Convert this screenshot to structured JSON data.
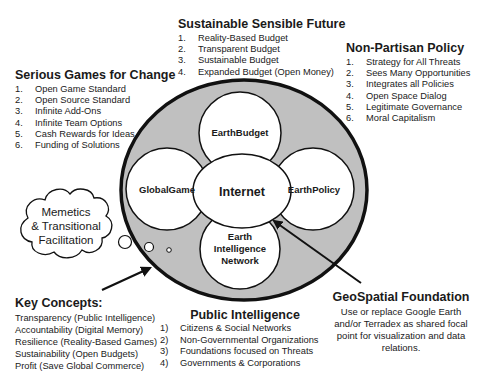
{
  "diagram": {
    "center": {
      "label": "Internet"
    },
    "nodes": [
      {
        "id": "earthbudget",
        "label": "EarthBudget"
      },
      {
        "id": "globalgame",
        "label": "GlobalGame"
      },
      {
        "id": "earthpolicy",
        "label": "EarthPolicy"
      },
      {
        "id": "ein",
        "label_lines": [
          "Earth",
          "Intelligence",
          "Network"
        ]
      }
    ],
    "cloud": {
      "lines": [
        "Memetics",
        "& Transitional",
        "Facilitation"
      ]
    },
    "colors": {
      "ring_fill": "#c0c0c0",
      "stroke": "#111111",
      "inner_fill": "#ffffff"
    }
  },
  "sustainable": {
    "title": "Sustainable Sensible Future",
    "items": [
      {
        "num": "1.",
        "text": "Reality-Based Budget"
      },
      {
        "num": "2.",
        "text": "Transparent Budget"
      },
      {
        "num": "3.",
        "text": "Sustainable Budget"
      },
      {
        "num": "4.",
        "text": "Expanded Budget (Open Money)"
      }
    ]
  },
  "nonpartisan": {
    "title": "Non-Partisan Policy",
    "items": [
      {
        "num": "1.",
        "text": "Strategy for All Threats"
      },
      {
        "num": "2.",
        "text": "Sees Many Opportunities"
      },
      {
        "num": "3.",
        "text": "Integrates all Policies"
      },
      {
        "num": "4.",
        "text": "Open Space Dialog"
      },
      {
        "num": "5.",
        "text": "Legitimate Governance"
      },
      {
        "num": "6.",
        "text": "Moral Capitalism"
      }
    ]
  },
  "serious": {
    "title": "Serious Games for Change",
    "items": [
      {
        "num": "1.",
        "text": "Open Game Standard"
      },
      {
        "num": "2.",
        "text": "Open Source Standard"
      },
      {
        "num": "3.",
        "text": "Infinite Add-Ons"
      },
      {
        "num": "4.",
        "text": "Infinite Team Options"
      },
      {
        "num": "5.",
        "text": "Cash Rewards for Ideas"
      },
      {
        "num": "6.",
        "text": "Funding of Solutions"
      }
    ]
  },
  "key_concepts": {
    "title": "Key Concepts:",
    "items": [
      "Transparency (Public Intelligence)",
      "Accountability (Digital Memory)",
      "Resilience (Reality-Based Games)",
      "Sustainability (Open Budgets)",
      "Profit (Save Global Commerce)"
    ]
  },
  "public_intelligence": {
    "title": "Public Intelligence",
    "items": [
      {
        "num": "1)",
        "text": "Citizens & Social Networks"
      },
      {
        "num": "2)",
        "text": "Non-Governmental Organizations"
      },
      {
        "num": "3)",
        "text": "Foundations focused on  Threats"
      },
      {
        "num": "4)",
        "text": "Governments & Corporations"
      }
    ]
  },
  "geospatial": {
    "title": "GeoSpatial Foundation",
    "lines": [
      "Use or replace Google Earth",
      "and/or Terradex as shared focal",
      "point for visualization and data",
      "relations."
    ]
  }
}
